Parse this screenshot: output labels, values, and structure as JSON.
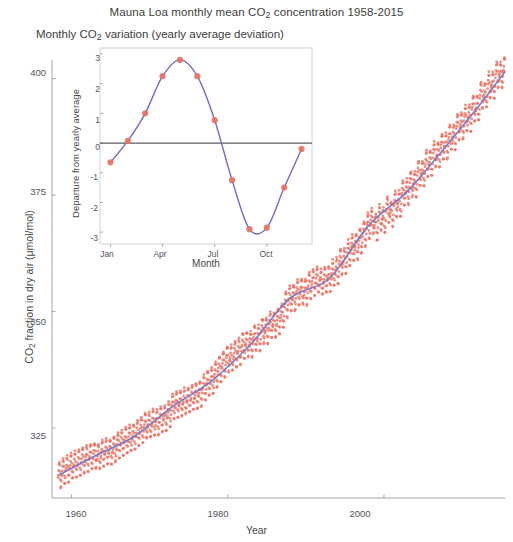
{
  "figure": {
    "inset_title": "Monthly CO₂ variation (yearly average deviation)"
  },
  "chart_data": [
    {
      "type": "scatter",
      "name": "main-keeling-curve",
      "title": "Mauna Loa monthly mean CO₂ concentration 1958-2015",
      "xlabel": "Year",
      "ylabel": "CO₂ fraction in dry air (μmol/mol)",
      "xlim": [
        1957.5,
        2015.5
      ],
      "ylim": [
        310,
        404
      ],
      "xticks": [
        1960,
        1980,
        2000
      ],
      "xtick_labels": [
        "1960",
        "1980",
        "2000"
      ],
      "yticks": [
        325,
        350,
        375,
        400
      ],
      "ytick_labels": [
        "325",
        "350",
        "375",
        "400"
      ],
      "grid": false,
      "legend": "none",
      "marker_color": "#e8705f",
      "line_color": "#7b78c8",
      "series": [
        {
          "name": "Monthly mean CO2 (scatter)",
          "marker": "dot",
          "x": [
            1958.5,
            1959,
            1959.5,
            1960,
            1960.5,
            1961,
            1961.5,
            1962,
            1962.5,
            1963,
            1963.5,
            1964,
            1964.5,
            1965,
            1965.5,
            1966,
            1966.5,
            1967,
            1967.5,
            1968,
            1968.5,
            1969,
            1969.5,
            1970,
            1970.5,
            1971,
            1971.5,
            1972,
            1972.5,
            1973,
            1973.5,
            1974,
            1974.5,
            1975,
            1975.5,
            1976,
            1976.5,
            1977,
            1977.5,
            1978,
            1978.5,
            1979,
            1979.5,
            1980,
            1980.5,
            1981,
            1981.5,
            1982,
            1982.5,
            1983,
            1983.5,
            1984,
            1984.5,
            1985,
            1985.5,
            1986,
            1986.5,
            1987,
            1987.5,
            1988,
            1988.5,
            1989,
            1989.5,
            1990,
            1990.5,
            1991,
            1991.5,
            1992,
            1992.5,
            1993,
            1993.5,
            1994,
            1994.5,
            1995,
            1995.5,
            1996,
            1996.5,
            1997,
            1997.5,
            1998,
            1998.5,
            1999,
            1999.5,
            2000,
            2000.5,
            2001,
            2001.5,
            2002,
            2002.5,
            2003,
            2003.5,
            2004,
            2004.5,
            2005,
            2005.5,
            2006,
            2006.5,
            2007,
            2007.5,
            2008,
            2008.5,
            2009,
            2009.5,
            2010,
            2010.5,
            2011,
            2011.5,
            2012,
            2012.5,
            2013,
            2013.5,
            2014,
            2014.5,
            2015,
            2015.5
          ],
          "y": [
            315.0,
            315.8,
            316.3,
            316.9,
            317.3,
            317.6,
            318.2,
            318.5,
            318.9,
            319.2,
            319.0,
            319.6,
            320.0,
            320.0,
            320.6,
            321.4,
            322.0,
            322.4,
            322.9,
            323.2,
            324.0,
            324.6,
            325.7,
            325.7,
            326.3,
            326.3,
            327.0,
            327.3,
            328.1,
            329.7,
            330.2,
            330.3,
            330.8,
            331.1,
            331.6,
            332.0,
            332.5,
            333.7,
            334.7,
            335.2,
            336.6,
            337.8,
            338.7,
            339.9,
            340.1,
            341.0,
            341.5,
            342.8,
            343.0,
            343.1,
            344.4,
            344.3,
            345.9,
            346.0,
            347.2,
            347.2,
            348.0,
            349.2,
            351.5,
            352.9,
            353.1,
            354.2,
            354.4,
            354.2,
            355.6,
            356.4,
            357.0,
            356.4,
            356.9,
            357.1,
            358.3,
            358.8,
            360.8,
            360.8,
            362.6,
            363.8,
            364.0,
            365.2,
            366.7,
            368.4,
            369.5,
            368.3,
            370.3,
            369.5,
            372.0,
            371.0,
            373.1,
            373.2,
            375.6,
            375.8,
            377.5,
            377.4,
            379.8,
            379.6,
            381.8,
            381.9,
            383.8,
            383.7,
            385.6,
            385.6,
            387.4,
            387.4,
            389.8,
            389.9,
            391.6,
            391.6,
            393.8,
            393.8,
            396.5,
            396.5,
            398.6,
            398.6,
            400.8,
            400.8,
            401.9
          ]
        },
        {
          "name": "Smoothed trend (line)",
          "marker": "none",
          "x": [
            1958.5,
            1963,
            1968,
            1973,
            1978,
            1983,
            1988,
            1993,
            1998,
            2003,
            2008,
            2012,
            2015.5
          ],
          "y": [
            315.0,
            319.0,
            323.2,
            329.7,
            335.2,
            343.1,
            352.9,
            357.1,
            368.4,
            375.8,
            385.6,
            393.8,
            401.5
          ]
        }
      ]
    },
    {
      "type": "line",
      "name": "inset-monthly-variation",
      "title": "Monthly CO₂ variation (yearly average deviation)",
      "xlabel": "Month",
      "ylabel": "Departure from yearly average",
      "xlim": [
        0.4,
        12.6
      ],
      "ylim": [
        -3.4,
        3.2
      ],
      "xticks": [
        1,
        4,
        7,
        10
      ],
      "xtick_labels": [
        "Jan",
        "Apr",
        "Jul",
        "Oct"
      ],
      "yticks": [
        -3,
        -2,
        -1,
        0,
        1,
        2,
        3
      ],
      "ytick_labels": [
        "-3",
        "-2",
        "-1",
        "0",
        "1",
        "2",
        "3"
      ],
      "grid": false,
      "legend": "none",
      "zero_line": true,
      "marker_color": "#e8705f",
      "line_color": "#6f6cc4",
      "categories": [
        "Jan",
        "Feb",
        "Mar",
        "Apr",
        "May",
        "Jun",
        "Jul",
        "Aug",
        "Sep",
        "Oct",
        "Nov",
        "Dec"
      ],
      "values": [
        -0.65,
        0.07,
        1.0,
        2.25,
        2.8,
        2.25,
        0.77,
        -1.25,
        -2.9,
        -2.85,
        -1.5,
        -0.2
      ]
    }
  ],
  "main_axis": {
    "xlabel": "Year",
    "ylabel": "CO₂ fraction in dry air (μmol/mol)",
    "xticks": [
      "1960",
      "1980",
      "2000"
    ],
    "yticks": [
      "400",
      "375",
      "350",
      "325"
    ]
  },
  "inset_axis": {
    "xlabel": "Month",
    "ylabel": "Departure from yearly average",
    "xticks": [
      "Jan",
      "Apr",
      "Jul",
      "Oct"
    ],
    "yticks": [
      "3",
      "2",
      "1",
      "0",
      "-1",
      "-2",
      "-3"
    ]
  }
}
